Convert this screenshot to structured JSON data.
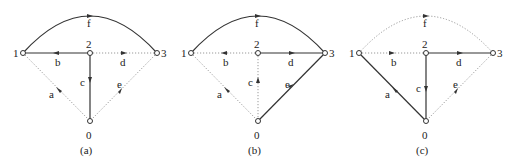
{
  "figure": {
    "panels": [
      {
        "caption": "(a)",
        "offset_x": 0,
        "nodes": {
          "n1": "1",
          "n2": "2",
          "n3": "3",
          "n0": "0"
        },
        "edges": {
          "a": {
            "label": "a",
            "style": "dotted"
          },
          "b": {
            "label": "b",
            "style": "solid"
          },
          "c": {
            "label": "c",
            "style": "solid"
          },
          "d": {
            "label": "d",
            "style": "dotted"
          },
          "e": {
            "label": "e",
            "style": "dotted"
          },
          "f": {
            "label": "f",
            "style": "solid"
          }
        }
      },
      {
        "caption": "(b)",
        "offset_x": 168,
        "nodes": {
          "n1": "1",
          "n2": "2",
          "n3": "3",
          "n0": "0"
        },
        "edges": {
          "a": {
            "label": "a",
            "style": "dotted"
          },
          "b": {
            "label": "b",
            "style": "dotted"
          },
          "c": {
            "label": "c",
            "style": "dotted"
          },
          "d": {
            "label": "d",
            "style": "solid"
          },
          "e": {
            "label": "e",
            "style": "solid"
          },
          "f": {
            "label": "f",
            "style": "solid"
          }
        }
      },
      {
        "caption": "(c)",
        "offset_x": 336,
        "nodes": {
          "n1": "1",
          "n2": "2",
          "n3": "3",
          "n0": "0"
        },
        "edges": {
          "a": {
            "label": "a",
            "style": "solid"
          },
          "b": {
            "label": "b",
            "style": "dotted"
          },
          "c": {
            "label": "c",
            "style": "solid"
          },
          "d": {
            "label": "d",
            "style": "solid"
          },
          "e": {
            "label": "e",
            "style": "dotted"
          },
          "f": {
            "label": "f",
            "style": "dotted"
          }
        }
      }
    ],
    "colors": {
      "solid_edge": "#333333",
      "dotted_edge": "#999999",
      "text": "#222222"
    }
  }
}
